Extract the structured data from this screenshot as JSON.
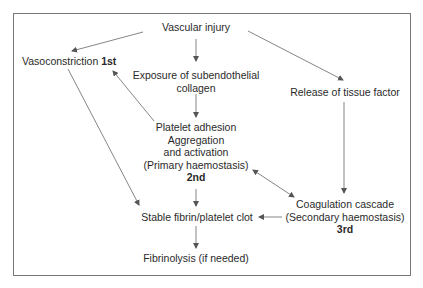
{
  "diagram": {
    "nodes": {
      "vascular_injury": "Vascular injury",
      "vasoconstriction": "Vasoconstriction",
      "vasoconstriction_order": "1st",
      "exposure_line1": "Exposure of subendothelial",
      "exposure_line2": "collagen",
      "tissue_factor": "Release of tissue factor",
      "platelet_line1": "Platelet adhesion",
      "platelet_line2": "Aggregation",
      "platelet_line3": "and activation",
      "platelet_line4": "(Primary haemostasis)",
      "platelet_order": "2nd",
      "coag_line1": "Coagulation cascade",
      "coag_line2": "(Secondary haemostasis)",
      "coag_order": "3rd",
      "clot": "Stable fibrin/platelet clot",
      "fibrinolysis": "Fibrinolysis (if needed)"
    },
    "edges": [
      {
        "from": "Vascular injury",
        "to": "Vasoconstriction"
      },
      {
        "from": "Vascular injury",
        "to": "Exposure of subendothelial collagen"
      },
      {
        "from": "Vascular injury",
        "to": "Release of tissue factor"
      },
      {
        "from": "Exposure of subendothelial collagen",
        "to": "Platelet adhesion"
      },
      {
        "from": "Platelet adhesion",
        "to": "Vasoconstriction"
      },
      {
        "from": "Vasoconstriction",
        "to": "Stable fibrin/platelet clot"
      },
      {
        "from": "Platelet adhesion",
        "to": "Stable fibrin/platelet clot"
      },
      {
        "from": "Platelet adhesion",
        "to": "Coagulation cascade",
        "bidirectional": true
      },
      {
        "from": "Release of tissue factor",
        "to": "Coagulation cascade"
      },
      {
        "from": "Coagulation cascade",
        "to": "Stable fibrin/platelet clot"
      },
      {
        "from": "Stable fibrin/platelet clot",
        "to": "Fibrinolysis (if needed)"
      }
    ]
  }
}
